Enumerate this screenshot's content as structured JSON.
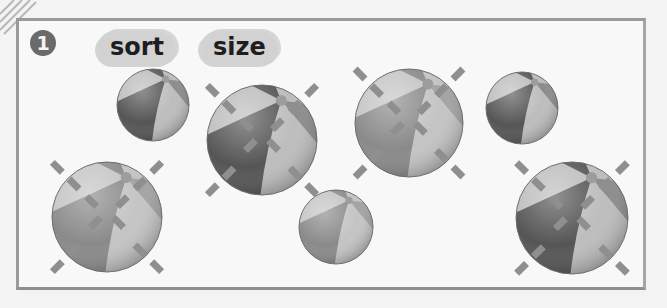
{
  "worksheet": {
    "exercise_number": "1",
    "words": [
      "sort",
      "size"
    ]
  },
  "colors": {
    "frame": "#9a9a9a",
    "badge": "#6a6a6a",
    "word_bubble": "#d2d2d2",
    "ball_dark": "#555555",
    "ball_mid": "#8c8c8c",
    "ball_light": "#bdbdbd",
    "ball_pale_dark": "#8a8a8a",
    "ball_pale_mid": "#a3a3a3",
    "ball_pale_light": "#c4c4c4",
    "mark": "#8f8f8f"
  },
  "balls": [
    {
      "id": "ball-1",
      "size": "small",
      "tone": "dark",
      "crossed": false,
      "outer_marks": false
    },
    {
      "id": "ball-2",
      "size": "large",
      "tone": "pale",
      "crossed": true,
      "outer_marks": true
    },
    {
      "id": "ball-3",
      "size": "large",
      "tone": "dark",
      "crossed": true,
      "outer_marks": true
    },
    {
      "id": "ball-4",
      "size": "small",
      "tone": "pale",
      "crossed": false,
      "outer_marks": false
    },
    {
      "id": "ball-5",
      "size": "large",
      "tone": "pale",
      "crossed": true,
      "outer_marks": true
    },
    {
      "id": "ball-6",
      "size": "small",
      "tone": "dark",
      "crossed": false,
      "outer_marks": false
    },
    {
      "id": "ball-7",
      "size": "large",
      "tone": "dark",
      "crossed": true,
      "outer_marks": true
    }
  ]
}
